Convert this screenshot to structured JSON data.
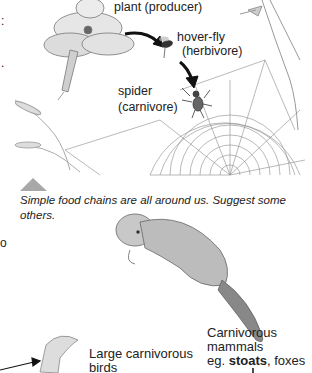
{
  "illustration": {
    "labels": {
      "plant": "plant (producer)",
      "hoverfly_line1": "hover-fly",
      "hoverfly_line2": "(herbivore)",
      "spider_line1": "spider",
      "spider_line2": "(carnivore)"
    },
    "caption_line1": "Simple food chains are all around us. Suggest some",
    "caption_line2": "others."
  },
  "lower": {
    "birds_line1": "Large carnivorous",
    "birds_line2": "birds",
    "mammals_line1": "Carnivorous",
    "mammals_line2": "mammals",
    "mammals_prefix": "eg. ",
    "mammals_bold": "stoats",
    "mammals_suffix": ", foxes"
  },
  "edge_text": [
    ":",
    ".",
    "o"
  ],
  "colors": {
    "triangle": "#a8a8a8",
    "arrow": "#111111",
    "web": "#888888"
  }
}
